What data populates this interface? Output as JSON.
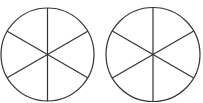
{
  "diagram": {
    "stroke_color": "#333333",
    "background": "#ffffff",
    "circles": [
      {
        "id": "circle-1",
        "cx": 47.5,
        "cy": 54.5,
        "r": 46.5,
        "sectors": 6
      },
      {
        "id": "circle-2",
        "cx": 153,
        "cy": 54.5,
        "r": 47,
        "sectors": 6
      }
    ]
  }
}
